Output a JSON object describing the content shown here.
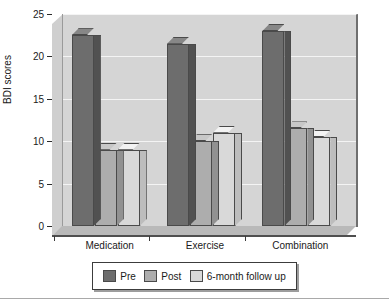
{
  "chart_data": {
    "type": "bar",
    "title": "",
    "xlabel": "",
    "ylabel": "BDI scores",
    "categories": [
      "Medication",
      "Exercise",
      "Combination"
    ],
    "series": [
      {
        "name": "Pre",
        "values": [
          22.5,
          21.5,
          23.0
        ],
        "color": "#6d6d6d"
      },
      {
        "name": "Post",
        "values": [
          9.0,
          10.0,
          11.5
        ],
        "color": "#adadad"
      },
      {
        "name": "6-month follow up",
        "values": [
          9.0,
          11.0,
          10.5
        ],
        "color": "#d9d9d9"
      }
    ],
    "ylim": [
      0,
      25
    ],
    "yticks": [
      0,
      5,
      10,
      15,
      20,
      25
    ],
    "ytick_labels": [
      "0",
      "5",
      "10",
      "15",
      "20",
      "25"
    ],
    "grid": true,
    "legend_position": "bottom",
    "style": "3d-bar"
  },
  "legend": {
    "items": [
      {
        "label": "Pre",
        "color": "#6d6d6d"
      },
      {
        "label": "Post",
        "color": "#adadad"
      },
      {
        "label": "6-month follow up",
        "color": "#d9d9d9"
      }
    ]
  },
  "colors": {
    "plot_background": "#d5d5d5",
    "gridline": "#f4f4f4",
    "axis": "#2b2b2b",
    "text": "#1a1a1a",
    "bar_outline": "#4a4a4a",
    "floor": "#b9b9b9"
  }
}
